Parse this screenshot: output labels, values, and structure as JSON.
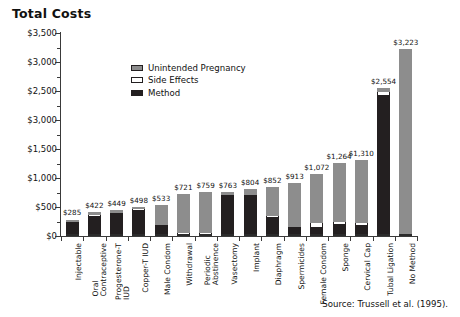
{
  "chart_data": {
    "type": "bar",
    "title": "Total Costs",
    "xlabel": "",
    "ylabel": "",
    "ylim": [
      0,
      3500
    ],
    "grid": false,
    "stacked": true,
    "legend_position": "inside-upper-left",
    "ytick_labels": [
      "$3,500",
      "$3,000",
      "$2,500",
      "$3,000",
      "$1,500",
      "$1,000",
      "$500",
      "$0"
    ],
    "ytick_values": [
      3500,
      3000,
      2500,
      2000,
      1500,
      1000,
      500,
      0
    ],
    "categories": [
      "Injectable",
      "Oral Contraceptive",
      "Progesterone-T IUD",
      "Copper-T IUD",
      "Male Condom",
      "Withdrawal",
      "Periodic Abstinence",
      "Vasectomy",
      "Implant",
      "Diaphragm",
      "Spermicides",
      "Female Condom",
      "Sponge",
      "Cervical Cap",
      "Tubal Ligation",
      "No Method"
    ],
    "values": [
      285,
      422,
      449,
      498,
      533,
      721,
      759,
      763,
      804,
      852,
      913,
      1072,
      1264,
      1310,
      2554,
      3223
    ],
    "value_labels": [
      "$285",
      "$422",
      "$449",
      "$498",
      "$533",
      "$721",
      "$759",
      "$763",
      "$804",
      "$852",
      "$913",
      "$1,072",
      "$1,264",
      "$1,310",
      "$2,554",
      "$3,223"
    ],
    "series": [
      {
        "name": "Method",
        "color": "#231f20",
        "values": [
          240,
          352,
          392,
          452,
          185,
          40,
          40,
          700,
          700,
          330,
          150,
          160,
          205,
          190,
          2430,
          0
        ]
      },
      {
        "name": "Side Effects",
        "color": "#ffffff",
        "values": [
          10,
          12,
          12,
          14,
          12,
          12,
          12,
          14,
          14,
          14,
          14,
          70,
          30,
          30,
          60,
          0
        ]
      },
      {
        "name": "Unintended Pregnancy",
        "color": "#8d8d8d",
        "values": [
          35,
          58,
          45,
          32,
          336,
          669,
          707,
          49,
          90,
          508,
          749,
          842,
          1029,
          1090,
          64,
          3223
        ]
      }
    ],
    "legend": [
      {
        "label": "Unintended Pregnancy",
        "swatch": "sw-preg"
      },
      {
        "label": "Side Effects",
        "swatch": "sw-side"
      },
      {
        "label": "Method",
        "swatch": "sw-method"
      }
    ],
    "source": "Source: Trussell et al. (1995)."
  }
}
